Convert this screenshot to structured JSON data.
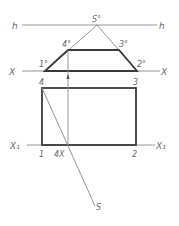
{
  "diagram": {
    "type": "descriptive-geometry-projection",
    "colors": {
      "thin_line": "#8a8a8a",
      "thick_line": "#3a3a3a",
      "label": "#6a6a6a",
      "background": "#ffffff"
    },
    "lines": {
      "h": {
        "left_label": "h",
        "right_label": "h"
      },
      "x": {
        "left_label": "X",
        "right_label": "X"
      },
      "x1": {
        "left_label": "X₁",
        "right_label": "X₁"
      }
    },
    "points": {
      "s_prime": "S°",
      "p4_prime": "4°",
      "p3_prime": "3°",
      "p1_prime": "1°",
      "p2_prime": "2°",
      "p4": "4",
      "p3": "3",
      "p1": "1",
      "p2": "2",
      "p4x": "4X",
      "s": "S"
    }
  }
}
